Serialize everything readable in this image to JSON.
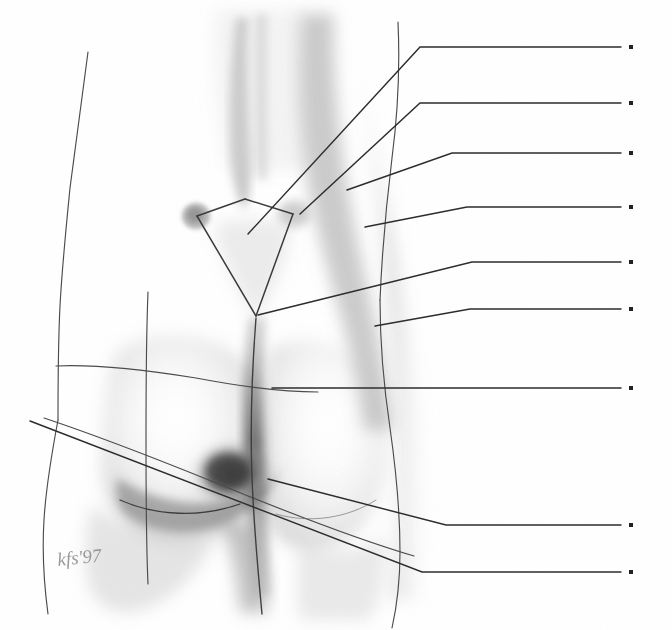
{
  "figure": {
    "medium": "graphite pencil drawing on paper",
    "background_color": "#ffffff",
    "line_color": "#2b2b2b",
    "shading_color": "#9a9a9a",
    "width": 672,
    "height": 630
  },
  "signature": {
    "text": "kfs'97",
    "year": "'97",
    "x": 58,
    "y": 566
  },
  "leader_lines": {
    "count": 9,
    "dot_color": "#1f1f1f",
    "dot_size": 4,
    "dot_x": 631,
    "items": [
      {
        "id": 1,
        "label": "",
        "anchor_x": 392,
        "anchor_y": 47,
        "bend_x": 420,
        "dot_y": 47,
        "origin_x": 248,
        "origin_y": 234
      },
      {
        "id": 2,
        "label": "",
        "anchor_x": 417,
        "anchor_y": 103,
        "bend_x": 420,
        "dot_y": 103,
        "origin_x": 300,
        "origin_y": 214
      },
      {
        "id": 3,
        "label": "",
        "anchor_x": 450,
        "anchor_y": 153,
        "bend_x": 452,
        "dot_y": 153,
        "origin_x": 347,
        "origin_y": 190
      },
      {
        "id": 4,
        "label": "",
        "anchor_x": 465,
        "anchor_y": 207,
        "bend_x": 467,
        "dot_y": 207,
        "origin_x": 365,
        "origin_y": 227
      },
      {
        "id": 5,
        "label": "",
        "anchor_x": 470,
        "anchor_y": 262,
        "bend_x": 472,
        "dot_y": 262,
        "origin_x": 258,
        "origin_y": 315
      },
      {
        "id": 6,
        "label": "",
        "anchor_x": 468,
        "anchor_y": 309,
        "bend_x": 470,
        "dot_y": 309,
        "origin_x": 375,
        "origin_y": 326
      },
      {
        "id": 7,
        "label": "",
        "anchor_x": 470,
        "anchor_y": 388,
        "bend_x": 472,
        "dot_y": 388,
        "origin_x": 272,
        "origin_y": 388
      },
      {
        "id": 8,
        "label": "",
        "anchor_x": 444,
        "anchor_y": 525,
        "bend_x": 446,
        "dot_y": 525,
        "origin_x": 268,
        "origin_y": 479
      },
      {
        "id": 9,
        "label": "",
        "anchor_x": 420,
        "anchor_y": 572,
        "bend_x": 422,
        "dot_y": 572,
        "origin_x": 30,
        "origin_y": 421
      }
    ]
  },
  "drawing_marks": {
    "sacral_triangle": "rhomboid of Michaelis outline connecting posterior superior iliac spines, lumbosacral point and coccyx",
    "reference_lines": [
      "left hip vertical contour line",
      "upper transverse reference line across buttock",
      "lower oblique reference line across buttock",
      "vertical plumb line through left buttock",
      "gluteal cleft midline",
      "gluteal fold curve"
    ]
  }
}
